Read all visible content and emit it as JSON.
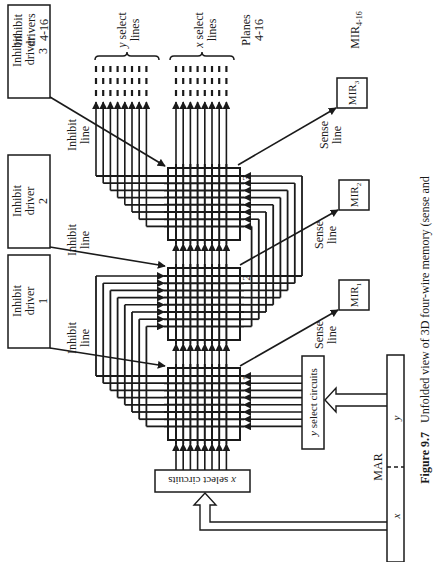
{
  "figure": {
    "caption_number": "Figure 9.7",
    "caption_text": "Unfolded view of 3D four-wire memory (sense and"
  },
  "labels": {
    "inhibit_drivers_group": [
      "Inhibit",
      "drivers",
      "4-16"
    ],
    "y_select_lines": [
      "y select",
      "lines"
    ],
    "x_select_lines": [
      "x select",
      "lines"
    ],
    "planes_group": [
      "Planes",
      "4-16"
    ],
    "mir_group": "MIR",
    "mir_group_sub": "4-16",
    "inhibit_line": [
      "Inhibit",
      "line"
    ],
    "sense_line": [
      "Sense",
      "line"
    ],
    "x_select_circuits": "x select circuits",
    "y_select_circuits": "y select circuits",
    "mar": "MAR",
    "mar_x": "x",
    "mar_y": "y"
  },
  "inhibit_drivers": [
    {
      "line1": "Inhibit",
      "line2": "driver",
      "num": "1"
    },
    {
      "line1": "Inhibit",
      "line2": "driver",
      "num": "2"
    },
    {
      "line1": "Inhibit",
      "line2": "driver",
      "num": "3"
    }
  ],
  "mirs": [
    {
      "label": "MIR",
      "sub": "1"
    },
    {
      "label": "MIR",
      "sub": "2"
    },
    {
      "label": "MIR",
      "sub": "3"
    }
  ],
  "planes": [
    {
      "number": "1"
    },
    {
      "number": "2"
    },
    {
      "number": "3"
    }
  ],
  "colors": {
    "ink": "#1a1a1a",
    "background": "#ffffff"
  }
}
